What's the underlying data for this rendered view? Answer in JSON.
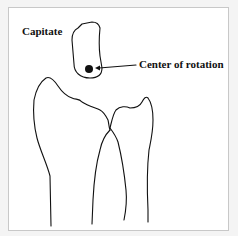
{
  "figure": {
    "labels": {
      "capitate": "Capitate",
      "center_of_rotation": "Center of rotation"
    },
    "colors": {
      "ink": "#111111",
      "background": "#ffffff",
      "border": "#c8c8c8"
    }
  }
}
